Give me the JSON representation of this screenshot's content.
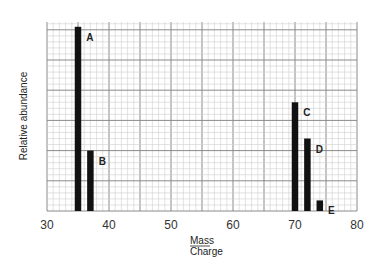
{
  "chart_data": {
    "type": "bar",
    "title": "",
    "xlabel_numerator": "Mass",
    "xlabel_denominator": "Charge",
    "ylabel": "Relative abundance",
    "xlim": [
      30,
      80
    ],
    "ylim": [
      0,
      6.3
    ],
    "x_ticks": [
      30,
      40,
      50,
      60,
      70,
      80
    ],
    "x_tick_labels": [
      "30",
      "40",
      "50",
      "60",
      "70",
      "80"
    ],
    "y_ticks_shown": false,
    "grid": true,
    "grid_major_x": 5,
    "grid_minor_x": 1,
    "grid_major_y": 1,
    "grid_minor_y": 0.2,
    "bars": [
      {
        "label": "A",
        "x": 35,
        "value": 6.1
      },
      {
        "label": "B",
        "x": 37,
        "value": 2.0
      },
      {
        "label": "C",
        "x": 70,
        "value": 3.6
      },
      {
        "label": "D",
        "x": 72,
        "value": 2.4
      },
      {
        "label": "E",
        "x": 74,
        "value": 0.35
      }
    ],
    "colors": {
      "bar": "#111111",
      "grid_major": "#8a8a8a",
      "grid_minor": "#cfcfcf"
    }
  }
}
